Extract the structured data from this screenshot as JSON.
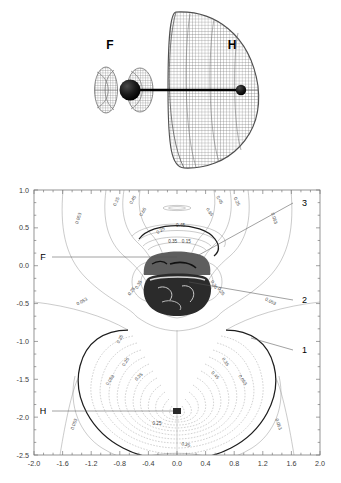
{
  "figure": {
    "title": "",
    "panels": [
      {
        "id": "orbital-3d",
        "type": "isosurface-mesh"
      },
      {
        "id": "contour-map",
        "type": "contour"
      }
    ]
  },
  "panel_3d": {
    "atom_labels": [
      {
        "name": "fluorine",
        "text": "F",
        "x": 110,
        "y": 45
      },
      {
        "name": "hydrogen",
        "text": "H",
        "x": 232,
        "y": 45
      }
    ],
    "atoms": [
      {
        "name": "fluorine-nucleus",
        "cx": 130,
        "cy": 90,
        "r": 10.5
      },
      {
        "name": "hydrogen-nucleus",
        "cx": 241,
        "cy": 90,
        "r": 5.2
      }
    ],
    "bond": {
      "x1": 130,
      "y1": 90,
      "x2": 241,
      "y2": 90
    },
    "mesh_color": "#6f6f6f",
    "lobes": [
      {
        "name": "small-back-lobe",
        "cx": 106,
        "cy": 90,
        "rx": 11,
        "ry": 22
      },
      {
        "name": "mid-lobe",
        "cx": 139,
        "cy": 90,
        "rx": 12,
        "ry": 21
      },
      {
        "name": "large-front-lobe",
        "cx": 205,
        "cy": 90,
        "rx": 53,
        "ry": 78
      }
    ]
  },
  "contour_plot": {
    "xaxis": {
      "label": "",
      "min": -2.0,
      "max": 2.0,
      "ticks": [
        "-2.0",
        "-1.6",
        "-1.2",
        "-0.8",
        "-0.4",
        "0.0",
        "0.4",
        "0.8",
        "1.2",
        "1.6",
        "2.0"
      ],
      "tick_values": [
        -2.0,
        -1.6,
        -1.2,
        -0.8,
        -0.4,
        0.0,
        0.4,
        0.8,
        1.2,
        1.6,
        2.0
      ],
      "minor_per_major": 2
    },
    "yaxis": {
      "label": "",
      "min": -2.5,
      "max": 1.0,
      "ticks": [
        "1.0",
        "0.5",
        "0.0",
        "-0.5",
        "-1.0",
        "-1.5",
        "-2.0",
        "-2.5"
      ],
      "tick_values": [
        1.0,
        0.5,
        0.0,
        -0.5,
        -1.0,
        -1.5,
        -2.0,
        -2.5
      ],
      "minor_per_major": 2
    },
    "atom_markers": [
      {
        "name": "fluorine",
        "label": "F",
        "x": 0.0,
        "y": 0.1,
        "label_x": -1.63,
        "label_y": 0.1
      },
      {
        "name": "hydrogen",
        "label": "H",
        "x": 0.0,
        "y": -1.93,
        "label_x": -1.63,
        "label_y": -1.93
      }
    ],
    "callouts": [
      {
        "name": "callout-3",
        "text": "3",
        "label_x": 1.92,
        "label_y": 0.83,
        "target_x": 0.28,
        "target_y": 0.13
      },
      {
        "name": "callout-2",
        "text": "2",
        "label_x": 1.92,
        "label_y": -0.45,
        "target_x": 0.17,
        "target_y": -0.21
      },
      {
        "name": "callout-1",
        "text": "1",
        "label_x": 1.92,
        "label_y": -1.11,
        "target_x": 1.03,
        "target_y": -0.95
      }
    ],
    "contour_levels": [
      "0.053",
      "0.25",
      "0.45",
      "0.65",
      "0.15",
      "0.35"
    ],
    "level_values": [
      0.053,
      0.15,
      0.25,
      0.35,
      0.45,
      0.65
    ],
    "contour_labels": [
      {
        "text": "0.053",
        "x": -1.36,
        "y": 0.62,
        "rot": -72
      },
      {
        "text": "0.25",
        "x": -0.83,
        "y": 0.84,
        "rot": -66
      },
      {
        "text": "0.45",
        "x": -0.6,
        "y": 0.86,
        "rot": -62
      },
      {
        "text": "0.65",
        "x": -0.46,
        "y": 0.7,
        "rot": -58
      },
      {
        "text": "0.65",
        "x": 0.44,
        "y": 0.7,
        "rot": 58
      },
      {
        "text": "0.45",
        "x": 0.58,
        "y": 0.86,
        "rot": 62
      },
      {
        "text": "0.25",
        "x": 0.82,
        "y": 0.84,
        "rot": 66
      },
      {
        "text": "0.053",
        "x": 1.34,
        "y": 0.62,
        "rot": 72
      },
      {
        "text": "0.45",
        "x": 0.05,
        "y": 0.51,
        "rot": 0
      },
      {
        "text": "0.25",
        "x": -0.22,
        "y": 0.45,
        "rot": -30
      },
      {
        "text": "0.35",
        "x": -0.06,
        "y": 0.3,
        "rot": 0
      },
      {
        "text": "0.15",
        "x": 0.13,
        "y": 0.3,
        "rot": 0
      },
      {
        "text": "0.053",
        "x": -1.32,
        "y": -0.49,
        "rot": -28
      },
      {
        "text": "0.053",
        "x": 1.3,
        "y": -0.49,
        "rot": 28
      },
      {
        "text": "0.25",
        "x": -0.62,
        "y": -0.35,
        "rot": -52
      },
      {
        "text": "0.25",
        "x": 0.6,
        "y": -0.35,
        "rot": 52
      },
      {
        "text": "0.35",
        "x": -0.52,
        "y": -0.26,
        "rot": -60
      },
      {
        "text": "0.35",
        "x": 0.5,
        "y": -0.26,
        "rot": 60
      },
      {
        "text": "0.053",
        "x": -0.92,
        "y": -1.52,
        "rot": -56
      },
      {
        "text": "0.053",
        "x": 0.9,
        "y": -1.52,
        "rot": 56
      },
      {
        "text": "0.053",
        "x": -1.42,
        "y": -2.1,
        "rot": -70
      },
      {
        "text": "0.053",
        "x": 1.4,
        "y": -2.1,
        "rot": 70
      },
      {
        "text": "0.25",
        "x": -0.28,
        "y": -2.1,
        "rot": 0
      },
      {
        "text": "0.25",
        "x": 0.12,
        "y": -2.38,
        "rot": 10
      },
      {
        "text": "0.35",
        "x": -0.78,
        "y": -0.98,
        "rot": -62
      },
      {
        "text": "0.25",
        "x": -0.7,
        "y": -1.28,
        "rot": -58
      },
      {
        "text": "0.35",
        "x": -0.52,
        "y": -1.48,
        "rot": -46
      },
      {
        "text": "0.45",
        "x": 0.52,
        "y": -1.46,
        "rot": 46
      },
      {
        "text": "0.35",
        "x": 0.66,
        "y": -1.28,
        "rot": 58
      }
    ]
  }
}
